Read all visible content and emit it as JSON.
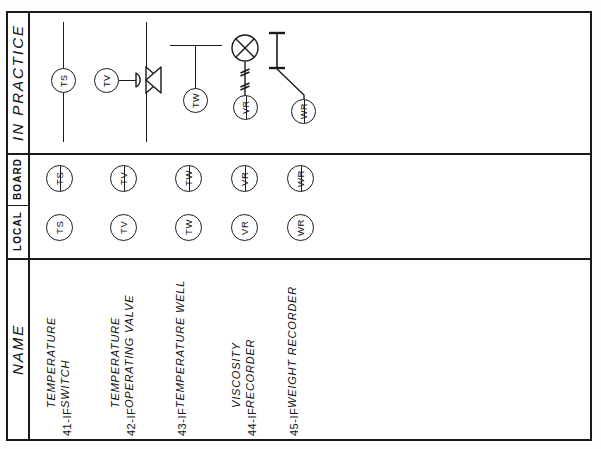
{
  "sheet": {
    "bands": {
      "practice_label": "IN  PRACTICE",
      "board_label": "BOARD",
      "local_label": "LOCAL",
      "name_label": "NAME"
    }
  },
  "instruments": [
    {
      "tag": "TS",
      "number": "41-IF",
      "name_line1": "TEMPERATURE",
      "name_line2": "SWITCH",
      "practice_symbol": "temperature-switch-inline-pipe"
    },
    {
      "tag": "TV",
      "number": "42-IF",
      "name_line1": "TEMPERATURE",
      "name_line2": "OPERATING  VALVE",
      "practice_symbol": "control-valve-with-diaphragm-actuator"
    },
    {
      "tag": "TW",
      "number": "43-IF",
      "name_line1": "TEMPERATURE  WELL",
      "name_line2": "",
      "practice_symbol": "thermowell-on-vessel-wall"
    },
    {
      "tag": "VR",
      "number": "44-IF",
      "name_line1": "VISCOSITY",
      "name_line2": "RECORDER",
      "practice_symbol": "viscometer-element-with-capillary"
    },
    {
      "tag": "WR",
      "number": "45-IF",
      "name_line1": "WEIGHT  RECORDER",
      "name_line2": "",
      "practice_symbol": "load-cell-with-board-recorder"
    }
  ],
  "colors": {
    "ink": "#1a1a1a",
    "paper": "#ffffff"
  }
}
